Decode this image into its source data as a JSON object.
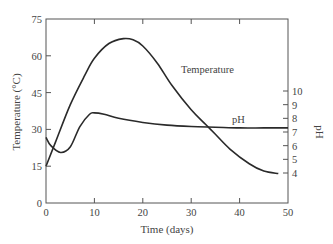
{
  "chart_data": {
    "type": "line",
    "title": "",
    "xlabel": "Time (days)",
    "ylabel": "Temperature (°C)",
    "y2label": "pH",
    "xlim": [
      0,
      50
    ],
    "ylim": [
      0,
      75
    ],
    "y2ticks": [
      4,
      5,
      6,
      7,
      8,
      9,
      10
    ],
    "xticks": [
      0,
      10,
      20,
      30,
      40,
      50
    ],
    "yticks": [
      0,
      15,
      30,
      45,
      60,
      75
    ],
    "grid": false,
    "legend": "inline labels",
    "series": [
      {
        "name": "Temperature",
        "axis": "left",
        "x": [
          0,
          2,
          5,
          8,
          10,
          13,
          16,
          18,
          20,
          23,
          26,
          30,
          33,
          35,
          38,
          42,
          45,
          48
        ],
        "values": [
          15,
          25,
          40,
          52,
          59,
          65,
          67,
          66.5,
          64,
          57,
          48,
          38,
          32,
          28,
          22,
          16,
          13,
          12
        ]
      },
      {
        "name": "pH",
        "axis": "right",
        "x": [
          0,
          1,
          3,
          5,
          7,
          9,
          10,
          12,
          15,
          20,
          25,
          30,
          35,
          40,
          45,
          50
        ],
        "values": [
          6.6,
          6.0,
          5.5,
          5.9,
          7.4,
          8.3,
          8.4,
          8.3,
          8.0,
          7.7,
          7.5,
          7.4,
          7.35,
          7.3,
          7.3,
          7.3
        ]
      }
    ],
    "annotations": [
      {
        "text": "Temperature",
        "x": 29,
        "y": 54
      },
      {
        "text": "pH",
        "x": 38,
        "y": 31
      }
    ]
  },
  "labels": {
    "xlabel": "Time (days)",
    "ylabel": "Temperature (°C)",
    "y2label": "pH",
    "temp_annot": "Temperature",
    "ph_annot": "pH"
  }
}
